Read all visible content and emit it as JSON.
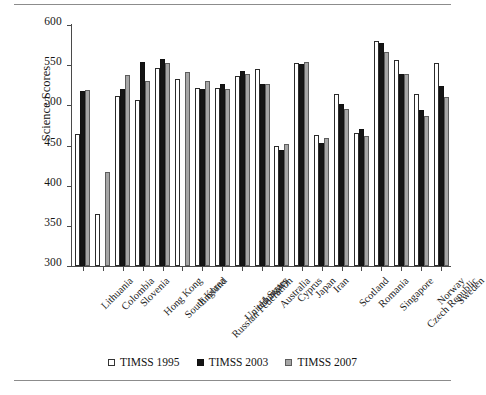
{
  "chart_data": {
    "type": "bar",
    "title": "",
    "xlabel": "",
    "ylabel": "Science Scores",
    "ylim": [
      300,
      600
    ],
    "yticks": [
      300,
      350,
      400,
      450,
      500,
      550,
      600
    ],
    "grid": false,
    "legend_position": "bottom-center",
    "categories": [
      "Lithuania",
      "Colombia",
      "Slovenia",
      "Hong Kong",
      "South Korea",
      "England",
      "Russian Federation",
      "United States",
      "Hungary",
      "Australia",
      "Cyprus",
      "Japan",
      "Iran",
      "Scotland",
      "Romania",
      "Singapore",
      "Czech Republic",
      "Norway",
      "Sweden"
    ],
    "series": [
      {
        "name": "TIMSS 1995",
        "color": "#ffffff",
        "values": [
          464,
          365,
          512,
          507,
          546,
          533,
          521,
          521,
          537,
          545,
          450,
          553,
          463,
          514,
          465,
          580,
          557,
          514,
          553
        ]
      },
      {
        "name": "TIMSS 2003",
        "color": "#151515",
        "values": [
          518,
          null,
          520,
          554,
          558,
          null,
          520,
          527,
          543,
          527,
          445,
          552,
          453,
          502,
          470,
          578,
          539,
          494,
          524
        ]
      },
      {
        "name": "TIMSS 2007",
        "color": "#a6a6a6",
        "values": [
          519,
          417,
          538,
          530,
          553,
          542,
          530,
          520,
          539,
          527,
          452,
          554,
          459,
          496,
          462,
          567,
          539,
          487,
          511
        ]
      }
    ]
  },
  "legend": {
    "entries": [
      {
        "label": "TIMSS 1995",
        "swatch": "white-square-icon"
      },
      {
        "label": "TIMSS 2003",
        "swatch": "black-square-icon"
      },
      {
        "label": "TIMSS 2007",
        "swatch": "gray-square-icon"
      }
    ]
  }
}
